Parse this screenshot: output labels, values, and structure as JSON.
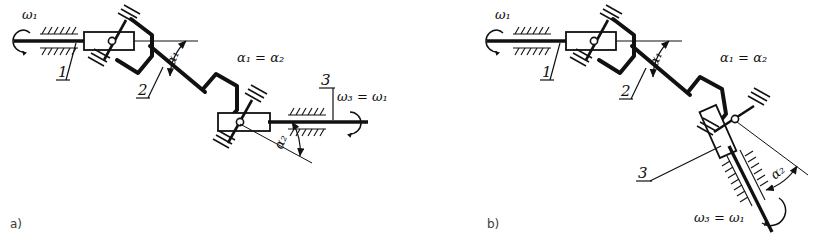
{
  "figure": {
    "kind": "engineering-line-drawing",
    "background_color": "#ffffff",
    "ink_color": "#111111"
  },
  "panels": [
    {
      "id": "a",
      "caption": "a)",
      "note": "Z-configuration: input and output shafts parallel, both horizontal",
      "labels": {
        "omega_in": "ω₁",
        "link_1": "1",
        "link_2": "2",
        "link_3": "3",
        "angle_1": "α₁",
        "angle_2": "α₂",
        "condition": "α₁ = α₂",
        "omega_out": "ω₃ = ω₁"
      }
    },
    {
      "id": "b",
      "caption": "b)",
      "note": "W-configuration: output shaft inclined downward",
      "labels": {
        "omega_in": "ω₁",
        "link_1": "1",
        "link_2": "2",
        "link_3": "3",
        "angle_1": "α₁",
        "angle_2": "α₂",
        "condition": "α₁ = α₂",
        "omega_out": "ω₃ = ω₁"
      }
    }
  ]
}
